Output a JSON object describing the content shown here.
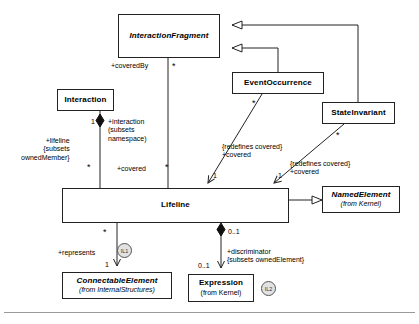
{
  "diagram": {
    "type": "uml-class-diagram",
    "background": "#ffffff",
    "line_color": "#222222"
  },
  "classes": [
    {
      "id": "interactionfragment",
      "name": "InteractionFragment",
      "abstract": true,
      "package": "",
      "x": 118,
      "y": 14,
      "w": 102,
      "h": 44
    },
    {
      "id": "interaction",
      "name": "Interaction",
      "abstract": false,
      "package": "",
      "x": 57,
      "y": 89,
      "w": 57,
      "h": 22
    },
    {
      "id": "eventoccurrence",
      "name": "EventOccurrence",
      "abstract": false,
      "package": "",
      "x": 232,
      "y": 72,
      "w": 92,
      "h": 22
    },
    {
      "id": "stateinvariant",
      "name": "StateInvariant",
      "abstract": false,
      "package": "",
      "x": 322,
      "y": 102,
      "w": 73,
      "h": 22
    },
    {
      "id": "lifeline",
      "name": "Lifeline",
      "abstract": false,
      "package": "",
      "x": 62,
      "y": 188,
      "w": 227,
      "h": 35
    },
    {
      "id": "namedelement",
      "name": "NamedElement",
      "abstract": true,
      "package": "(from Kernel)",
      "x": 322,
      "y": 186,
      "w": 78,
      "h": 27
    },
    {
      "id": "connectableelement",
      "name": "ConnectableElement",
      "abstract": true,
      "package": "(from InternalStructures)",
      "x": 62,
      "y": 272,
      "w": 110,
      "h": 27
    },
    {
      "id": "expression",
      "name": "Expression",
      "abstract": false,
      "package": "(from Kernel)",
      "x": 188,
      "y": 274,
      "w": 66,
      "h": 28
    }
  ],
  "badges": [
    {
      "id": "il1",
      "label": "IL1",
      "x": 117,
      "y": 243
    },
    {
      "id": "il2",
      "label": "IL2",
      "x": 261,
      "y": 281
    }
  ],
  "labels": [
    {
      "id": "coveredby",
      "text": "+coveredBy",
      "x": 111,
      "y": 62
    },
    {
      "id": "star-top",
      "text": "*",
      "x": 172,
      "y": 62,
      "kind": "star"
    },
    {
      "id": "one-left",
      "text": "1",
      "x": 91,
      "y": 118,
      "kind": "mult"
    },
    {
      "id": "interaction-role",
      "text": "+interaction\n(subsets\nnamespace)",
      "x": 108,
      "y": 118
    },
    {
      "id": "lifeline-role",
      "text": "+lifeline\n{subsets\nownedMember}",
      "x": 21,
      "y": 137
    },
    {
      "id": "star-covered-l",
      "text": "*",
      "x": 87,
      "y": 163,
      "kind": "star"
    },
    {
      "id": "covered-left",
      "text": "+covered",
      "x": 117,
      "y": 165
    },
    {
      "id": "star-covered-r",
      "text": "*",
      "x": 165,
      "y": 163,
      "kind": "star"
    },
    {
      "id": "star-eo",
      "text": "*",
      "x": 252,
      "y": 99,
      "kind": "star"
    },
    {
      "id": "star-si",
      "text": "*",
      "x": 336,
      "y": 131,
      "kind": "star"
    },
    {
      "id": "redefines-eo",
      "text": "{redefines covered}\n+covered",
      "x": 222,
      "y": 143
    },
    {
      "id": "one-eo",
      "text": "1",
      "x": 213,
      "y": 172,
      "kind": "mult"
    },
    {
      "id": "redefines-si",
      "text": "{redefines covered}\n+covered",
      "x": 290,
      "y": 160
    },
    {
      "id": "one-si",
      "text": "1",
      "x": 278,
      "y": 172,
      "kind": "mult"
    },
    {
      "id": "star-represents",
      "text": "*",
      "x": 103,
      "y": 228,
      "kind": "star"
    },
    {
      "id": "represents",
      "text": "+represents",
      "x": 58,
      "y": 249
    },
    {
      "id": "one-ce",
      "text": "1",
      "x": 105,
      "y": 261,
      "kind": "mult"
    },
    {
      "id": "zeroone-top",
      "text": "0..1",
      "x": 228,
      "y": 228,
      "kind": "mult"
    },
    {
      "id": "discriminator",
      "text": "+discriminator\n{subsets ownedElement}",
      "x": 227,
      "y": 248
    },
    {
      "id": "zeroone-bottom",
      "text": "0..1",
      "x": 198,
      "y": 262,
      "kind": "mult"
    }
  ],
  "relations": [
    {
      "id": "eo-generalizes-if",
      "kind": "generalization",
      "from": "eventoccurrence",
      "to": "interactionfragment"
    },
    {
      "id": "si-generalizes-if",
      "kind": "generalization",
      "from": "stateinvariant",
      "to": "interactionfragment"
    },
    {
      "id": "lifeline-generalizes-ne",
      "kind": "generalization",
      "from": "lifeline",
      "to": "namedelement"
    },
    {
      "id": "if-covers-lifeline",
      "kind": "association",
      "from": "interactionfragment",
      "to": "lifeline"
    },
    {
      "id": "interaction-owns-lifeline",
      "kind": "composition",
      "from": "interaction",
      "to": "lifeline"
    },
    {
      "id": "eo-covered-lifeline",
      "kind": "association-arrow",
      "from": "eventoccurrence",
      "to": "lifeline"
    },
    {
      "id": "si-covered-lifeline",
      "kind": "association-arrow",
      "from": "stateinvariant",
      "to": "lifeline"
    },
    {
      "id": "lifeline-represents-ce",
      "kind": "association-arrow",
      "from": "lifeline",
      "to": "connectableelement"
    },
    {
      "id": "lifeline-owns-expression",
      "kind": "composition-arrow",
      "from": "lifeline",
      "to": "expression"
    }
  ]
}
